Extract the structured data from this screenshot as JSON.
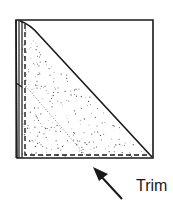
{
  "diagram": {
    "label": "Trim",
    "stroke_color": "#1a1a1a",
    "stipple_color": "#555555",
    "arrow_points_to": "bottom dashed edge (trim line)",
    "parts": [
      {
        "name": "square-outline",
        "description": "square outline"
      },
      {
        "name": "shaded-triangle",
        "description": "stippled lower-left triangle"
      },
      {
        "name": "fold-diagonal",
        "description": "solid diagonal fold from top-left to bottom-right"
      },
      {
        "name": "inner-dotted-diagonal",
        "description": "faint dotted inner crease"
      },
      {
        "name": "trim-line",
        "description": "dashed trim line along left and bottom edges"
      },
      {
        "name": "left-fold-edge",
        "description": "doubled folded edge on left side"
      },
      {
        "name": "trim-arrow",
        "description": "arrow pointing to trim line"
      }
    ]
  }
}
